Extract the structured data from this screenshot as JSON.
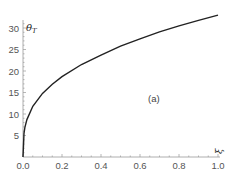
{
  "chart_data": {
    "type": "line",
    "title": "",
    "xlabel": "ξ",
    "ylabel": "θ_T",
    "annotation": "(a)",
    "xlim": [
      0,
      1.0
    ],
    "ylim": [
      0,
      33
    ],
    "xticks": [
      "0.0",
      "0.2",
      "0.4",
      "0.6",
      "0.8",
      "1.0"
    ],
    "yticks": [
      "5",
      "10",
      "15",
      "20",
      "25",
      "30"
    ],
    "grid": false,
    "series": [
      {
        "name": "theta_T",
        "x": [
          0.0,
          0.005,
          0.01,
          0.02,
          0.05,
          0.1,
          0.15,
          0.2,
          0.3,
          0.4,
          0.5,
          0.6,
          0.7,
          0.8,
          0.9,
          1.0
        ],
        "y": [
          0.0,
          5.5,
          6.9,
          8.7,
          11.8,
          14.8,
          16.9,
          18.7,
          21.5,
          23.7,
          25.8,
          27.5,
          29.1,
          30.5,
          31.8,
          33.0
        ]
      }
    ]
  }
}
